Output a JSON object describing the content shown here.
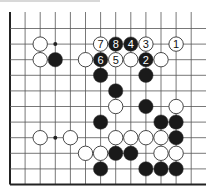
{
  "diagram": {
    "type": "go-board-fragment",
    "grid": {
      "columns": 13,
      "rows": 11,
      "open_edges": [
        "top",
        "right"
      ],
      "closed_edges": [
        "left",
        "bottom"
      ]
    },
    "hoshi": [
      {
        "c": 3,
        "r": 1
      },
      {
        "c": 3,
        "r": 7
      }
    ],
    "stones": [
      {
        "c": 2,
        "r": 1,
        "color": "white"
      },
      {
        "c": 6,
        "r": 1,
        "color": "white",
        "label": "7"
      },
      {
        "c": 7,
        "r": 1,
        "color": "black",
        "label": "8"
      },
      {
        "c": 8,
        "r": 1,
        "color": "black",
        "label": "4"
      },
      {
        "c": 9,
        "r": 1,
        "color": "white",
        "label": "3"
      },
      {
        "c": 11,
        "r": 1,
        "color": "white",
        "label": "1"
      },
      {
        "c": 2,
        "r": 2,
        "color": "white"
      },
      {
        "c": 3,
        "r": 2,
        "color": "black"
      },
      {
        "c": 5,
        "r": 2,
        "color": "white"
      },
      {
        "c": 6,
        "r": 2,
        "color": "black",
        "label": "6"
      },
      {
        "c": 7,
        "r": 2,
        "color": "white",
        "label": "5"
      },
      {
        "c": 8,
        "r": 2,
        "color": "white"
      },
      {
        "c": 9,
        "r": 2,
        "color": "black",
        "label": "2"
      },
      {
        "c": 10,
        "r": 2,
        "color": "white"
      },
      {
        "c": 6,
        "r": 3,
        "color": "black"
      },
      {
        "c": 9,
        "r": 3,
        "color": "black"
      },
      {
        "c": 7,
        "r": 4,
        "color": "black"
      },
      {
        "c": 7,
        "r": 5,
        "color": "white"
      },
      {
        "c": 9,
        "r": 5,
        "color": "black"
      },
      {
        "c": 11,
        "r": 5,
        "color": "white"
      },
      {
        "c": 6,
        "r": 6,
        "color": "black"
      },
      {
        "c": 10,
        "r": 6,
        "color": "black"
      },
      {
        "c": 11,
        "r": 6,
        "color": "black"
      },
      {
        "c": 2,
        "r": 7,
        "color": "white"
      },
      {
        "c": 4,
        "r": 7,
        "color": "white"
      },
      {
        "c": 7,
        "r": 7,
        "color": "white"
      },
      {
        "c": 8,
        "r": 7,
        "color": "white"
      },
      {
        "c": 9,
        "r": 7,
        "color": "white"
      },
      {
        "c": 10,
        "r": 7,
        "color": "white"
      },
      {
        "c": 11,
        "r": 7,
        "color": "black"
      },
      {
        "c": 5,
        "r": 8,
        "color": "white"
      },
      {
        "c": 6,
        "r": 8,
        "color": "white"
      },
      {
        "c": 7,
        "r": 8,
        "color": "black"
      },
      {
        "c": 8,
        "r": 8,
        "color": "black"
      },
      {
        "c": 10,
        "r": 8,
        "color": "white"
      },
      {
        "c": 11,
        "r": 8,
        "color": "white"
      },
      {
        "c": 6,
        "r": 9,
        "color": "black"
      },
      {
        "c": 9,
        "r": 9,
        "color": "black"
      },
      {
        "c": 10,
        "r": 9,
        "color": "black"
      },
      {
        "c": 11,
        "r": 9,
        "color": "black"
      }
    ]
  },
  "colors": {
    "line": "#555555",
    "edge": "#222222",
    "black_stone": "#1a1a1a",
    "white_stone": "#ffffff",
    "stone_outline": "#333333"
  }
}
